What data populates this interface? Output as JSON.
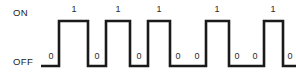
{
  "figure": {
    "width": 296,
    "height": 79,
    "background_color": "#ffffff",
    "line_color": "#1a1a1a",
    "line_width": 2.6
  },
  "axis": {
    "on_label": "ON",
    "off_label": "OFF"
  },
  "chart_data": {
    "type": "line",
    "title": "",
    "xlabel": "",
    "ylabel": "",
    "levels": {
      "high": "ON",
      "low": "OFF"
    },
    "bit_sequence": [
      0,
      1,
      0,
      1,
      0,
      1,
      0,
      0,
      1,
      0,
      0,
      1,
      0
    ],
    "high_level_y": 21,
    "low_level_y": 66,
    "segments": [
      {
        "index": 0,
        "value": "0",
        "level": "low",
        "x_start": 41,
        "x_end": 59
      },
      {
        "index": 1,
        "value": "1",
        "level": "high",
        "x_start": 59,
        "x_end": 88
      },
      {
        "index": 2,
        "value": "0",
        "level": "low",
        "x_start": 88,
        "x_end": 106
      },
      {
        "index": 3,
        "value": "1",
        "level": "high",
        "x_start": 106,
        "x_end": 130
      },
      {
        "index": 4,
        "value": "0",
        "level": "low",
        "x_start": 130,
        "x_end": 148
      },
      {
        "index": 5,
        "value": "1",
        "level": "high",
        "x_start": 148,
        "x_end": 170
      },
      {
        "index": 6,
        "value": "0",
        "level": "low",
        "x_start": 170,
        "x_end": 188
      },
      {
        "index": 7,
        "value": "0",
        "level": "low",
        "x_start": 188,
        "x_end": 206
      },
      {
        "index": 8,
        "value": "1",
        "level": "high",
        "x_start": 206,
        "x_end": 229
      },
      {
        "index": 9,
        "value": "0",
        "level": "low",
        "x_start": 229,
        "x_end": 247
      },
      {
        "index": 10,
        "value": "0",
        "level": "low",
        "x_start": 247,
        "x_end": 264
      },
      {
        "index": 11,
        "value": "1",
        "level": "high",
        "x_start": 264,
        "x_end": 283
      },
      {
        "index": 12,
        "value": "0",
        "level": "low",
        "x_start": 283,
        "x_end": 296
      }
    ],
    "one_labels": [
      {
        "text": "1",
        "x": 74
      },
      {
        "text": "1",
        "x": 118
      },
      {
        "text": "1",
        "x": 159
      },
      {
        "text": "1",
        "x": 217
      },
      {
        "text": "1",
        "x": 273
      }
    ],
    "zero_labels": [
      {
        "text": "0",
        "x": 51
      },
      {
        "text": "0",
        "x": 97
      },
      {
        "text": "0",
        "x": 139
      },
      {
        "text": "0",
        "x": 178
      },
      {
        "text": "0",
        "x": 197
      },
      {
        "text": "0",
        "x": 237
      },
      {
        "text": "0",
        "x": 255
      },
      {
        "text": "0",
        "x": 290
      }
    ],
    "path": "M 41 66 L 59 66 L 59 21 L 88 21 L 88 66 L 106 66 L 106 21 L 130 21 L 130 66 L 148 66 L 148 21 L 170 21 L 170 66 L 206 66 L 206 21 L 229 21 L 229 66 L 264 66 L 264 21 L 283 21 L 283 66 L 296 66"
  }
}
